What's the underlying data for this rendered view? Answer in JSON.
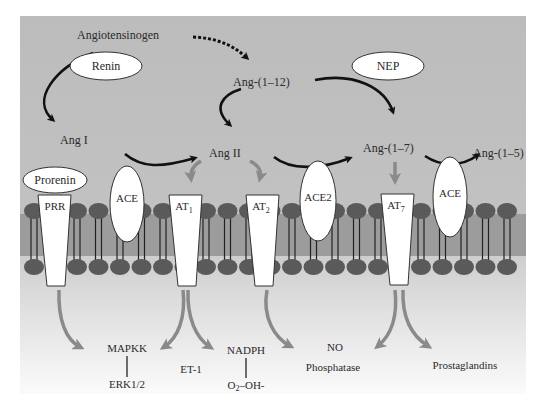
{
  "diagram": {
    "type": "renin-angiotensin-system-pathway",
    "extracellular": {
      "molecules": {
        "angiotensinogen": "Angiotensinogen",
        "ang1": "Ang I",
        "ang112": "Ang-(1–12)",
        "ang2": "Ang II",
        "ang17": "Ang-(1–7)",
        "ang15": "Ang-(1–5)"
      },
      "enzymes": {
        "renin": "Renin",
        "nep": "NEP",
        "prorenin": "Prorenin"
      }
    },
    "membrane": {
      "proteins": {
        "prr": "PRR",
        "ace_left": "ACE",
        "at1": "AT",
        "at1_sub": "1",
        "at2": "AT",
        "at2_sub": "2",
        "ace2": "ACE2",
        "at7": "AT",
        "at7_sub": "7",
        "ace_right": "ACE"
      }
    },
    "intracellular": {
      "mapkk": "MAPKK",
      "erk": "ERK1/2",
      "et1": "ET-1",
      "nadph": "NADPH",
      "ros_o2": "O",
      "ros_sub": "2",
      "ros_rest": "–OH-",
      "no": "NO",
      "phosphatase": "Phosphatase",
      "prostaglandins": "Prostaglandins"
    },
    "colors": {
      "extracellular_bg": "#bdbdbd",
      "membrane_band": "#9a9a9a",
      "lipid_head": "#5c5c5c",
      "receptor_fill": "#ffffff",
      "black_arrow": "#111111",
      "grey_arrow": "#8a8a8a"
    }
  }
}
